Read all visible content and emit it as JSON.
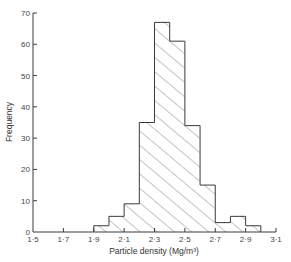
{
  "chart_data": {
    "type": "bar",
    "subtype": "histogram",
    "title": "",
    "xlabel": "Particle density (Mg/m³)",
    "ylabel": "Frequency",
    "xlim": [
      1.5,
      3.1
    ],
    "ylim": [
      0,
      70
    ],
    "bin_width": 0.1,
    "bin_edges": [
      1.9,
      2.0,
      2.1,
      2.2,
      2.3,
      2.4,
      2.5,
      2.6,
      2.7,
      2.8,
      2.9,
      3.0
    ],
    "categories": [
      "1.9-2.0",
      "2.0-2.1",
      "2.1-2.2",
      "2.2-2.3",
      "2.3-2.4",
      "2.4-2.5",
      "2.5-2.6",
      "2.6-2.7",
      "2.7-2.8",
      "2.8-2.9",
      "2.9-3.0"
    ],
    "values": [
      2,
      5,
      9,
      35,
      67,
      61,
      34,
      15,
      3,
      5,
      2
    ],
    "x_ticks": [
      1.5,
      1.7,
      1.9,
      2.1,
      2.3,
      2.5,
      2.7,
      2.9,
      3.1
    ],
    "x_tick_labels": [
      "1·5",
      "1·7",
      "1·9",
      "2·1",
      "2·3",
      "2·5",
      "2·7",
      "2·9",
      "3·1"
    ],
    "y_ticks": [
      0,
      10,
      20,
      30,
      40,
      50,
      60,
      70
    ],
    "y_tick_labels": [
      "0",
      "10",
      "20",
      "30",
      "40",
      "50",
      "60",
      "70"
    ],
    "fill": "diagonal hatch",
    "grid": false,
    "legend": null
  },
  "colors": {
    "line": "#3a3a3a",
    "hatch": "#555555",
    "background": "#ffffff"
  }
}
